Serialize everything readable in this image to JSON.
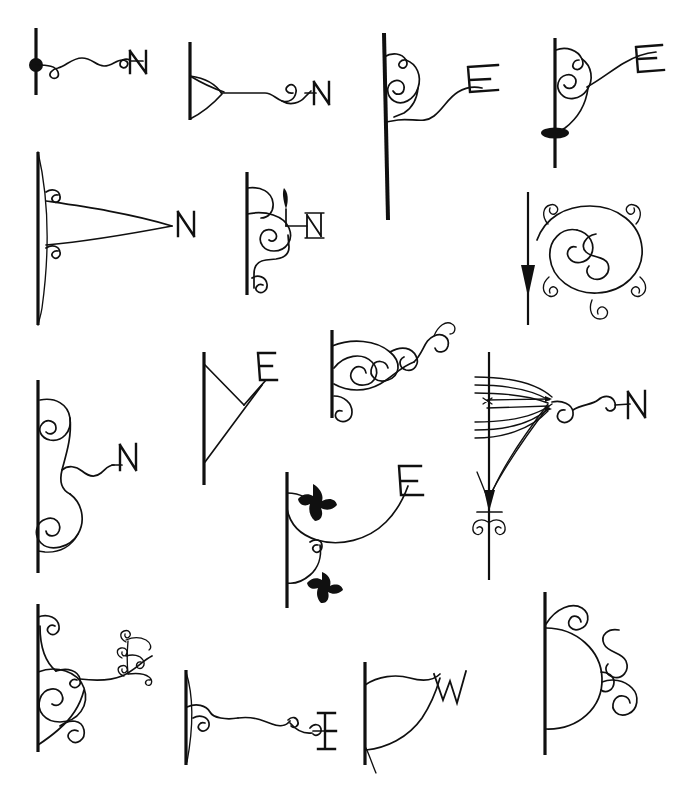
{
  "page": {
    "title": "Decorative Wrought-Iron Bracket Designs",
    "description": "Scanned sheet of sixteen hand-drawn ornamental iron sign-bracket and scrollwork designs, each mounted on a vertical post and terminating in a compass letter.",
    "background_color": "#ffffff",
    "ink_color": "#101010",
    "width": 674,
    "height": 797
  },
  "rows": [
    {
      "index": 1,
      "label": "Row 1"
    },
    {
      "index": 2,
      "label": "Row 2"
    },
    {
      "index": 3,
      "label": "Row 3"
    },
    {
      "index": 4,
      "label": "Row 4"
    }
  ],
  "designs": [
    {
      "id": "design-1",
      "row": 1,
      "column": 1,
      "letter": "N",
      "post": "vertical-thin-post-with-ball-finial",
      "motifs": [
        "ball-joint",
        "s-curve-scrollwork",
        "end-curl"
      ],
      "caption": "Straight post with ball, wavy scroll arm ending in N"
    },
    {
      "id": "design-2",
      "row": 1,
      "column": 2,
      "letter": "N",
      "post": "vertical-post-with-taper-bracket",
      "motifs": [
        "triangular-gusset",
        "wave-arm",
        "curl"
      ],
      "caption": "Tapered triangular gusset with wavy arm ending in N"
    },
    {
      "id": "design-3",
      "row": 1,
      "column": 3,
      "letter": "E",
      "post": "long-tapered-post",
      "motifs": [
        "double-volute",
        "swan-neck-arm"
      ],
      "caption": "Long tapered post with double volute and swan-neck arm ending in E"
    },
    {
      "id": "design-4",
      "row": 1,
      "column": 4,
      "letter": "E",
      "post": "vertical-post-with-lens-boss",
      "motifs": [
        "volute",
        "arched-arm",
        "lens-boss"
      ],
      "caption": "Post with lens-shaped boss, volute and arched arm ending in E"
    },
    {
      "id": "design-5",
      "row": 2,
      "column": 1,
      "letter": "N",
      "post": "bowed-vertical-post",
      "motifs": [
        "twin-curls",
        "long-triangular-arm"
      ],
      "caption": "Bowed post with twin curls and long lens-shaped arm ending in N"
    },
    {
      "id": "design-6",
      "row": 2,
      "column": 2,
      "letter": "N",
      "post": "vertical-post",
      "motifs": [
        "large-volute",
        "bud-finial",
        "foot-curl",
        "straight-arm"
      ],
      "caption": "Post with large volute, bud finial and straight arm ending in small N"
    },
    {
      "id": "design-7",
      "row": 2,
      "column": 3,
      "letter": "S",
      "post": "vertical-post-with-arrowhead",
      "motifs": [
        "oval-ring",
        "center-s-scroll",
        "four-corner-curls",
        "arrowhead"
      ],
      "caption": "Post with downward arrowhead and oval ring enclosing an S scroll"
    },
    {
      "id": "design-8",
      "row": 3,
      "column": 1,
      "letter": "N",
      "post": "vertical-post",
      "motifs": [
        "upper-volute",
        "lower-large-volute",
        "wavy-arm"
      ],
      "caption": "Post with upper and lower volutes and a wavy arm ending in N"
    },
    {
      "id": "design-9",
      "row": 3,
      "column": 2,
      "letter": "E",
      "post": "vertical-post",
      "motifs": [
        "triangular-strut-bracket",
        "diagonal-arm"
      ],
      "caption": "Plain triangular strut bracket with diagonal arm ending in E"
    },
    {
      "id": "design-10",
      "row": 3,
      "column": 3,
      "letter": "",
      "post": "vertical-post",
      "motifs": [
        "cloud-scroll-cluster",
        "multiple-curls",
        "foot-curl"
      ],
      "caption": "Dense cluster of cloud-like scrolls and curls, no letter"
    },
    {
      "id": "design-11",
      "row": 3,
      "column": 4,
      "letter": "N",
      "post": "vertical-post-with-arrow-and-curls",
      "motifs": [
        "fan-of-arcs",
        "barbed-arrow",
        "bow-tie-knot",
        "curl-arm"
      ],
      "caption": "Post with fan of arcs, barbed arrow and scrolled arm ending in N"
    },
    {
      "id": "design-12",
      "row": 3,
      "column": 5,
      "letter": "E",
      "post": "vertical-post",
      "motifs": [
        "leaf-sprays",
        "deep-sweep-arm",
        "small-curl"
      ],
      "caption": "Post with two black leaf sprays and deep sweeping arm ending in E"
    },
    {
      "id": "design-13",
      "row": 4,
      "column": 1,
      "letter": "E",
      "post": "vertical-post",
      "motifs": [
        "top-curl",
        "large-spiral",
        "foot-curl",
        "curled-letter"
      ],
      "caption": "Post with spiral scrollwork and a fully curled ornamental E"
    },
    {
      "id": "design-14",
      "row": 4,
      "column": 2,
      "letter": "E",
      "post": "lens-shaped-post",
      "motifs": [
        "double-curl",
        "long-wave-arm"
      ],
      "caption": "Lens-shaped post with long wavy arm and small curls ending in E"
    },
    {
      "id": "design-15",
      "row": 4,
      "column": 3,
      "letter": "W",
      "post": "vertical-post",
      "motifs": [
        "leaf-shaped-bracket",
        "zigzag-letter"
      ],
      "caption": "Leaf-shaped bracket outline with zigzag W"
    },
    {
      "id": "design-16",
      "row": 4,
      "column": 4,
      "letter": "S",
      "post": "vertical-post",
      "motifs": [
        "half-round-bracket",
        "top-curl",
        "s-scroll",
        "end-curl"
      ],
      "caption": "Half-round bracket with top curl and free-standing S scroll"
    }
  ],
  "letters_used": [
    "N",
    "E",
    "S",
    "W"
  ],
  "letter_counts": {
    "N": 5,
    "E": 5,
    "S": 2,
    "W": 1,
    "none": 3
  }
}
